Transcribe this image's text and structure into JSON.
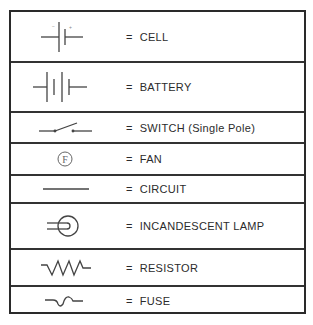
{
  "legend": {
    "rows": [
      {
        "symbol": "cell-symbol",
        "equals": "=",
        "label": "CELL",
        "top": 0,
        "height": 51
      },
      {
        "symbol": "battery-symbol",
        "equals": "=",
        "label": "BATTERY",
        "top": 51,
        "height": 50
      },
      {
        "symbol": "switch-single-pole-symbol",
        "equals": "=",
        "label": "SWITCH (Single Pole)",
        "top": 101,
        "height": 31
      },
      {
        "symbol": "fan-symbol",
        "equals": "=",
        "label": "FAN",
        "top": 132,
        "height": 32
      },
      {
        "symbol": "circuit-symbol",
        "equals": "=",
        "label": "CIRCUIT",
        "top": 164,
        "height": 28
      },
      {
        "symbol": "incandescent-lamp-symbol",
        "equals": "=",
        "label": "INCANDESCENT LAMP",
        "top": 192,
        "height": 46
      },
      {
        "symbol": "resistor-symbol",
        "equals": "=",
        "label": "RESISTOR",
        "top": 238,
        "height": 37
      },
      {
        "symbol": "fuse-symbol",
        "equals": "=",
        "label": "FUSE",
        "top": 275,
        "height": 27
      }
    ],
    "cell_marks": {
      "negative": "−",
      "positive": "+"
    },
    "fan_letter": "F"
  }
}
